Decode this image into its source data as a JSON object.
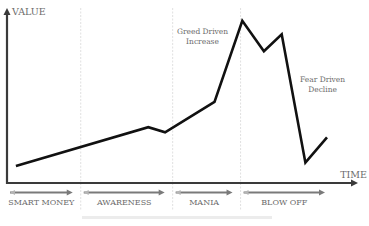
{
  "chart_data": {
    "type": "line",
    "title": "",
    "xlabel": "TIME",
    "ylabel": "VALUE",
    "grid": false,
    "xlim": [
      0,
      100
    ],
    "ylim": [
      0,
      100
    ],
    "series": [
      {
        "name": "Bubble value",
        "x": [
          2.6,
          41.2,
          46.1,
          60.5,
          68.6,
          74.9,
          80.1,
          87.0,
          93.3
        ],
        "y": [
          10,
          33,
          30,
          48,
          96,
          78,
          88,
          12,
          27
        ]
      }
    ],
    "phases": [
      {
        "label": "SMART MONEY",
        "start": 0,
        "end": 21.5
      },
      {
        "label": "AWARENESS",
        "start": 21.5,
        "end": 48.3
      },
      {
        "label": "MANIA",
        "start": 48.3,
        "end": 68.1
      },
      {
        "label": "BLOW OFF",
        "start": 68.1,
        "end": 100
      }
    ],
    "phase_dividers": [
      21.5,
      48.3,
      68.1
    ],
    "annotations": [
      {
        "text": [
          "Greed Driven",
          "Increase"
        ],
        "x": 57,
        "y": 88
      },
      {
        "text": [
          "Fear Driven",
          "Decline"
        ],
        "x": 92,
        "y": 60
      }
    ]
  },
  "colors": {
    "line": "#111111",
    "axis": "#3a3a3a",
    "phase_arrow": "#7a7a7a",
    "divider": "#e0e0e0",
    "label": "#6b6b6b"
  }
}
